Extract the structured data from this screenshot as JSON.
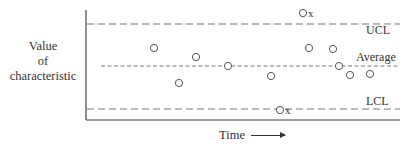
{
  "chart_data": {
    "type": "scatter",
    "title": "",
    "xlabel": "Time",
    "ylabel": [
      "Value",
      "of",
      "characteristic"
    ],
    "grid": false,
    "legend": null,
    "reference_lines": [
      {
        "name": "UCL",
        "label": "UCL",
        "y_px": 24,
        "style": "dashed"
      },
      {
        "name": "Average",
        "label": "Average",
        "y_px": 66,
        "style": "dashed-fine"
      },
      {
        "name": "LCL",
        "label": "LCL",
        "y_px": 109,
        "style": "dashed"
      }
    ],
    "points": [
      {
        "x": 154,
        "y": 48,
        "out_of_control": false
      },
      {
        "x": 179,
        "y": 83,
        "out_of_control": false
      },
      {
        "x": 196,
        "y": 57,
        "out_of_control": false
      },
      {
        "x": 228,
        "y": 66,
        "out_of_control": false
      },
      {
        "x": 271,
        "y": 76,
        "out_of_control": false
      },
      {
        "x": 280,
        "y": 110,
        "out_of_control": true,
        "marker_label": "x"
      },
      {
        "x": 303,
        "y": 13,
        "out_of_control": true,
        "marker_label": "x"
      },
      {
        "x": 309,
        "y": 48,
        "out_of_control": false
      },
      {
        "x": 333,
        "y": 49,
        "out_of_control": false
      },
      {
        "x": 339,
        "y": 66,
        "out_of_control": false
      },
      {
        "x": 350,
        "y": 75,
        "out_of_control": false
      },
      {
        "x": 370,
        "y": 74,
        "out_of_control": false
      }
    ],
    "annotations": [
      "UCL",
      "Average",
      "LCL"
    ]
  },
  "labels": {
    "y_line1": "Value",
    "y_line2": "of",
    "y_line3": "characteristic",
    "x_axis": "Time",
    "ucl": "UCL",
    "average": "Average",
    "lcl": "LCL",
    "out_marker": "x"
  },
  "colors": {
    "axis": "#444444",
    "line": "#666666",
    "text": "#333333"
  }
}
